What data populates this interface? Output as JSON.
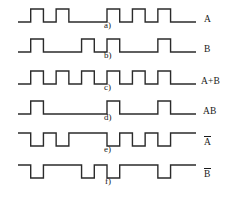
{
  "figure": {
    "type": "digital-timing-diagram",
    "width": 230,
    "height": 198,
    "background_color": "#ffffff",
    "stroke_color": "#2b2b2b",
    "text_color": "#1a1a1a"
  },
  "timebase": {
    "x_start": 18,
    "x_end": 196,
    "slots": 14,
    "slot_width": 12.714,
    "high_amplitude": 13
  },
  "waveforms": [
    {
      "id": "a",
      "sub_label": "a)",
      "signal_label": "A",
      "overbar": false,
      "baseline_y": 22,
      "sub_label_x": 104,
      "sub_label_y": 20,
      "label_x": 204,
      "label_y": 14,
      "bits": [
        0,
        1,
        0,
        1,
        0,
        0,
        0,
        1,
        0,
        1,
        0,
        1,
        0,
        0
      ]
    },
    {
      "id": "b",
      "sub_label": "b)",
      "signal_label": "B",
      "overbar": false,
      "baseline_y": 52,
      "sub_label_x": 104,
      "sub_label_y": 50,
      "label_x": 204,
      "label_y": 44,
      "bits": [
        0,
        1,
        0,
        0,
        0,
        1,
        0,
        1,
        0,
        0,
        0,
        1,
        0,
        0
      ]
    },
    {
      "id": "c",
      "sub_label": "c)",
      "signal_label": "A+B",
      "overbar": false,
      "baseline_y": 84,
      "sub_label_x": 104,
      "sub_label_y": 82,
      "label_x": 201,
      "label_y": 76,
      "bits": [
        0,
        1,
        0,
        1,
        0,
        1,
        0,
        1,
        0,
        1,
        0,
        1,
        0,
        0
      ]
    },
    {
      "id": "d",
      "sub_label": "d)",
      "signal_label": "AB",
      "overbar": false,
      "baseline_y": 114,
      "sub_label_x": 104,
      "sub_label_y": 112,
      "label_x": 203,
      "label_y": 106,
      "bits": [
        0,
        1,
        0,
        0,
        0,
        0,
        0,
        1,
        0,
        0,
        0,
        1,
        0,
        0
      ]
    },
    {
      "id": "e",
      "sub_label": "e)",
      "signal_label": "A",
      "overbar": true,
      "baseline_y": 146,
      "sub_label_x": 104,
      "sub_label_y": 144,
      "label_x": 204,
      "label_y": 136,
      "bits": [
        1,
        0,
        1,
        0,
        1,
        1,
        1,
        0,
        1,
        0,
        1,
        0,
        1,
        1
      ]
    },
    {
      "id": "f",
      "sub_label": "f)",
      "signal_label": "B",
      "overbar": true,
      "baseline_y": 178,
      "sub_label_x": 105,
      "sub_label_y": 176,
      "label_x": 204,
      "label_y": 168,
      "bits": [
        1,
        0,
        1,
        1,
        1,
        0,
        1,
        0,
        1,
        1,
        1,
        0,
        1,
        1
      ]
    }
  ]
}
